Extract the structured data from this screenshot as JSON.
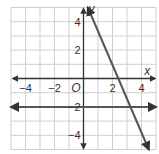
{
  "chart_data": {
    "type": "line",
    "title": "",
    "xlabel": "x",
    "ylabel": "y",
    "origin_label": "O",
    "xlim": [
      -5,
      5
    ],
    "ylim": [
      -5,
      5
    ],
    "grid": true,
    "x_ticks": [
      {
        "value": -4,
        "label": "−4"
      },
      {
        "value": -2,
        "label": "−2"
      },
      {
        "value": 2,
        "label": "2"
      },
      {
        "value": 4,
        "label": "4"
      }
    ],
    "y_ticks": [
      {
        "value": 4,
        "label": "4"
      },
      {
        "value": 2,
        "label": "2"
      },
      {
        "value": -2,
        "label": "−2"
      },
      {
        "value": -4,
        "label": "−4"
      }
    ],
    "series": [
      {
        "name": "horizontal line",
        "equation": "y = -2",
        "points": [
          [
            -5,
            -2
          ],
          [
            5,
            -2
          ]
        ]
      },
      {
        "name": "decreasing line",
        "equation": "y = -2x + 4",
        "points": [
          [
            0.3,
            5
          ],
          [
            4.5,
            -5
          ]
        ]
      }
    ],
    "colors": {
      "grid": "#cfcfcf",
      "axes": "#333333",
      "lines": "#555555"
    }
  }
}
